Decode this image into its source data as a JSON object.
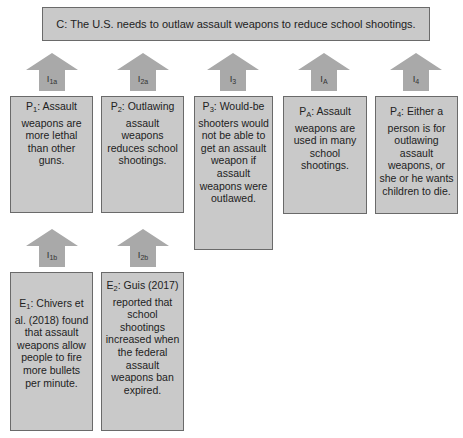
{
  "claim": {
    "text": "C: The U.S. needs to outlaw assault weapons to reduce school shootings."
  },
  "arrows": [
    {
      "id": "I1a",
      "base": "I",
      "sub": "1a"
    },
    {
      "id": "I2a",
      "base": "I",
      "sub": "2a"
    },
    {
      "id": "I3",
      "base": "I",
      "sub": "3"
    },
    {
      "id": "IA",
      "base": "I",
      "sub": "A"
    },
    {
      "id": "I4",
      "base": "I",
      "sub": "4"
    },
    {
      "id": "I1b",
      "base": "I",
      "sub": "1b"
    },
    {
      "id": "I2b",
      "base": "I",
      "sub": "2b"
    }
  ],
  "premises": [
    {
      "id": "P1",
      "base": "P",
      "sub": "1",
      "text": ": Assault weapons are more lethal than other guns."
    },
    {
      "id": "P2",
      "base": "P",
      "sub": "2",
      "text": ": Outlawing assault weapons reduces school shootings."
    },
    {
      "id": "P3",
      "base": "P",
      "sub": "3",
      "text": ": Would-be shooters would not be able to get an assault weapon if assault weapons were outlawed."
    },
    {
      "id": "PA",
      "base": "P",
      "sub": "A",
      "text": ": Assault weapons are used in many school shootings."
    },
    {
      "id": "P4",
      "base": "P",
      "sub": "4",
      "text": ": Either a person is for outlawing assault weapons, or she or he wants children to die."
    }
  ],
  "evidence": [
    {
      "id": "E1",
      "base": "E",
      "sub": "1",
      "text": ": Chivers et al. (2018) found that assault weapons allow people to fire more bullets per minute."
    },
    {
      "id": "E2",
      "base": "E",
      "sub": "2",
      "text": ": Guis (2017) reported that school shootings increased when the federal assault weapons ban expired."
    }
  ],
  "colors": {
    "box_fill": "#c9c9c9",
    "box_border": "#6a6a6a",
    "arrow_fill": "#a9a9a9"
  }
}
